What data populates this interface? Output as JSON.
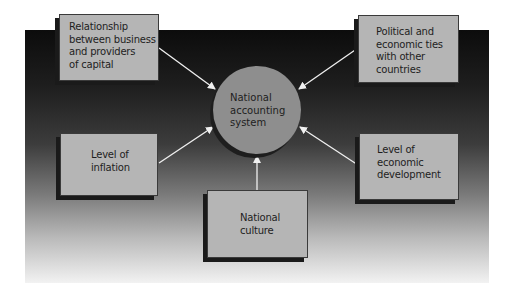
{
  "diagram": {
    "center": {
      "lines": [
        "National",
        "accounting",
        "system"
      ]
    },
    "factors": [
      {
        "id": "capital-providers",
        "lines": [
          "Relationship",
          "between business",
          "and providers",
          "of capital"
        ]
      },
      {
        "id": "political-ties",
        "lines": [
          "Political and",
          "economic ties",
          "with other",
          "countries"
        ]
      },
      {
        "id": "inflation",
        "lines": [
          "Level of",
          "inflation"
        ]
      },
      {
        "id": "economic-development",
        "lines": [
          "Level of",
          "economic",
          "development"
        ]
      },
      {
        "id": "culture",
        "lines": [
          "National",
          "culture"
        ]
      }
    ],
    "arrows": [
      {
        "from": "capital-providers",
        "to": "center"
      },
      {
        "from": "political-ties",
        "to": "center"
      },
      {
        "from": "inflation",
        "to": "center"
      },
      {
        "from": "economic-development",
        "to": "center"
      },
      {
        "from": "culture",
        "to": "center"
      }
    ]
  },
  "colors": {
    "box_fill": "#b5b5b5",
    "circle_fill": "#8e8e8e",
    "arrow": "#f0f0f0",
    "background_top": "#0c0c0c",
    "background_bottom": "#f2f2f2"
  }
}
